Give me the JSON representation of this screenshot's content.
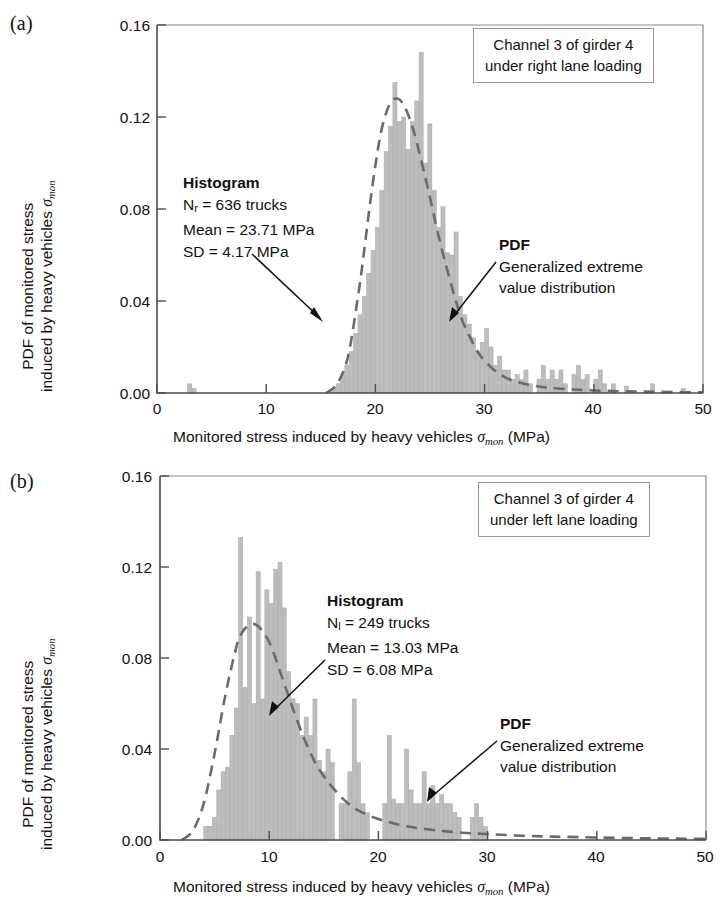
{
  "figure": {
    "panels": [
      {
        "id": "a",
        "panel_label": "(a)",
        "legend": {
          "line1": "Channel 3 of girder 4",
          "line2": "under right lane loading"
        },
        "histogram_annotation": {
          "header": "Histogram",
          "line1_prefix": "N",
          "line1_sub": "r",
          "line1_rest": " = 636 trucks",
          "line2": "Mean = 23.71 MPa",
          "line3": "SD = 4.17 MPa"
        },
        "pdf_annotation": {
          "header": "PDF",
          "line1": "Generalized extreme",
          "line2": "value distribution"
        }
      },
      {
        "id": "b",
        "panel_label": "(b)",
        "legend": {
          "line1": "Channel 3 of girder 4",
          "line2": "under left lane loading"
        },
        "histogram_annotation": {
          "header": "Histogram",
          "line1_prefix": "N",
          "line1_sub": "l",
          "line1_rest": " = 249 trucks",
          "line2": "Mean = 13.03 MPa",
          "line3": "SD = 6.08 MPa"
        },
        "pdf_annotation": {
          "header": "PDF",
          "line1": "Generalized extreme",
          "line2": "value distribution"
        }
      }
    ],
    "axis_label_parts": {
      "y_line1": "PDF of monitored stress",
      "y_line2_prefix": "induced by heavy vehicles ",
      "y_line2_symbol": "σ",
      "y_line2_symbol_sub": "mon",
      "x_prefix": "Monitored stress induced by heavy vehicles ",
      "x_symbol": "σ",
      "x_symbol_sub": "mon",
      "x_suffix": " (MPa)"
    },
    "colors": {
      "bar_fill": "#bdbdbd",
      "bar_edge": "#a8a8a8",
      "pdf_curve": "#6b6b6b",
      "axis": "#4d4d4d",
      "text": "#111111",
      "legend_border": "#9a9a9a"
    }
  },
  "chart_data": [
    {
      "type": "bar",
      "panel": "a",
      "title": "Channel 3 of girder 4 under right lane loading",
      "xlabel": "Monitored stress induced by heavy vehicles σ_mon (MPa)",
      "ylabel": "PDF of monitored stress induced by heavy vehicles σ_mon",
      "xlim": [
        0,
        50
      ],
      "ylim": [
        0,
        0.16
      ],
      "xticks": [
        0,
        10,
        20,
        30,
        40,
        50
      ],
      "ytick_labels": [
        "0.00",
        "0.04",
        "0.08",
        "0.12",
        "0.16"
      ],
      "yticks": [
        0.0,
        0.04,
        0.08,
        0.12,
        0.16
      ],
      "grid": false,
      "legend_position": "top-right",
      "n_samples": 636,
      "mean": 23.71,
      "sd": 4.17,
      "bin_width": 0.4,
      "bin_centers": [
        3.0,
        3.4,
        16.2,
        16.6,
        17.0,
        17.4,
        17.8,
        18.2,
        18.6,
        19.0,
        19.4,
        19.8,
        20.2,
        20.6,
        21.0,
        21.4,
        21.8,
        22.2,
        22.6,
        23.0,
        23.4,
        23.8,
        24.2,
        24.6,
        25.0,
        25.4,
        25.8,
        26.2,
        26.6,
        27.0,
        27.4,
        27.8,
        28.2,
        28.6,
        29.0,
        29.4,
        29.8,
        30.2,
        30.6,
        31.0,
        31.4,
        31.8,
        32.2,
        32.6,
        33.0,
        33.4,
        33.8,
        34.2,
        35.0,
        35.4,
        35.8,
        36.2,
        36.6,
        37.0,
        37.4,
        38.2,
        38.6,
        39.0,
        39.4,
        40.2,
        40.6,
        41.0,
        41.8,
        43.0,
        45.4,
        48.2
      ],
      "bin_values": [
        0.004,
        0.002,
        0.002,
        0.004,
        0.008,
        0.012,
        0.018,
        0.026,
        0.034,
        0.042,
        0.052,
        0.062,
        0.072,
        0.088,
        0.105,
        0.116,
        0.135,
        0.118,
        0.12,
        0.106,
        0.118,
        0.127,
        0.148,
        0.1,
        0.117,
        0.088,
        0.072,
        0.081,
        0.061,
        0.06,
        0.07,
        0.042,
        0.034,
        0.03,
        0.024,
        0.018,
        0.022,
        0.028,
        0.02,
        0.012,
        0.016,
        0.01,
        0.01,
        0.006,
        0.008,
        0.006,
        0.01,
        0.004,
        0.006,
        0.012,
        0.006,
        0.01,
        0.006,
        0.01,
        0.004,
        0.008,
        0.012,
        0.006,
        0.008,
        0.006,
        0.01,
        0.004,
        0.004,
        0.003,
        0.004,
        0.002
      ],
      "pdf_curve": {
        "name": "Generalized extreme value distribution",
        "style": "dashed",
        "x": [
          15.5,
          16.5,
          17.5,
          18.5,
          19.0,
          19.5,
          20.0,
          20.5,
          21.0,
          21.5,
          22.0,
          22.5,
          23.0,
          23.5,
          24.0,
          24.5,
          25.0,
          25.5,
          26.0,
          26.5,
          27.0,
          27.5,
          28.0,
          28.5,
          29.0,
          29.5,
          30.0,
          31.0,
          32.0,
          33.0,
          34.0,
          35.0,
          36.0,
          38.0,
          40.0,
          43.0,
          46.0,
          50.0
        ],
        "y": [
          0.0,
          0.004,
          0.016,
          0.045,
          0.063,
          0.082,
          0.099,
          0.113,
          0.122,
          0.127,
          0.128,
          0.126,
          0.121,
          0.114,
          0.105,
          0.095,
          0.085,
          0.074,
          0.064,
          0.055,
          0.046,
          0.038,
          0.031,
          0.026,
          0.021,
          0.017,
          0.014,
          0.0095,
          0.0065,
          0.0048,
          0.0036,
          0.0028,
          0.0022,
          0.0015,
          0.0011,
          0.0007,
          0.0005,
          0.0003
        ]
      }
    },
    {
      "type": "bar",
      "panel": "b",
      "title": "Channel 3 of girder 4 under left lane loading",
      "xlabel": "Monitored stress induced by heavy vehicles σ_mon (MPa)",
      "ylabel": "PDF of monitored stress induced by heavy vehicles σ_mon",
      "xlim": [
        0,
        50
      ],
      "ylim": [
        0,
        0.16
      ],
      "xticks": [
        0,
        10,
        20,
        30,
        40,
        50
      ],
      "ytick_labels": [
        "0.00",
        "0.04",
        "0.08",
        "0.12",
        "0.16"
      ],
      "yticks": [
        0.0,
        0.04,
        0.08,
        0.12,
        0.16
      ],
      "grid": false,
      "legend_position": "top-right",
      "n_samples": 249,
      "mean": 13.03,
      "sd": 6.08,
      "bin_width": 0.4,
      "bin_centers": [
        4.2,
        4.6,
        5.0,
        5.4,
        5.8,
        6.2,
        6.6,
        7.0,
        7.4,
        7.8,
        8.2,
        8.6,
        9.0,
        9.4,
        9.8,
        10.2,
        10.6,
        11.0,
        11.4,
        11.8,
        12.2,
        12.6,
        13.0,
        13.4,
        13.8,
        14.2,
        14.6,
        15.0,
        15.4,
        15.8,
        16.6,
        17.0,
        17.4,
        17.8,
        18.2,
        18.6,
        19.0,
        20.6,
        21.0,
        21.4,
        21.8,
        22.2,
        22.6,
        23.0,
        23.4,
        23.8,
        24.2,
        24.6,
        25.0,
        25.4,
        25.8,
        26.2,
        26.6,
        27.0,
        27.4,
        28.6,
        29.0,
        29.4,
        29.8
      ],
      "bin_values": [
        0.006,
        0.006,
        0.01,
        0.022,
        0.03,
        0.032,
        0.046,
        0.058,
        0.133,
        0.067,
        0.098,
        0.06,
        0.118,
        0.062,
        0.11,
        0.104,
        0.119,
        0.122,
        0.102,
        0.074,
        0.062,
        0.06,
        0.046,
        0.054,
        0.046,
        0.062,
        0.035,
        0.03,
        0.04,
        0.034,
        0.016,
        0.016,
        0.03,
        0.062,
        0.034,
        0.016,
        0.012,
        0.016,
        0.046,
        0.018,
        0.016,
        0.016,
        0.04,
        0.022,
        0.016,
        0.016,
        0.03,
        0.016,
        0.024,
        0.016,
        0.02,
        0.016,
        0.016,
        0.012,
        0.01,
        0.01,
        0.016,
        0.01,
        0.006
      ],
      "pdf_curve": {
        "name": "Generalized extreme value distribution",
        "style": "dashed",
        "x": [
          2.0,
          3.0,
          4.0,
          5.0,
          6.0,
          7.0,
          7.5,
          8.0,
          8.5,
          9.0,
          9.5,
          10.0,
          10.5,
          11.0,
          11.5,
          12.0,
          13.0,
          14.0,
          15.0,
          16.0,
          17.0,
          18.0,
          19.0,
          20.0,
          21.0,
          22.0,
          23.0,
          24.0,
          25.0,
          26.0,
          28.0,
          30.0,
          33.0,
          36.0,
          40.0,
          45.0,
          50.0
        ],
        "y": [
          0.0,
          0.004,
          0.016,
          0.038,
          0.064,
          0.085,
          0.091,
          0.094,
          0.095,
          0.094,
          0.091,
          0.087,
          0.081,
          0.074,
          0.067,
          0.06,
          0.047,
          0.036,
          0.028,
          0.022,
          0.017,
          0.0135,
          0.011,
          0.0092,
          0.0078,
          0.0066,
          0.0057,
          0.005,
          0.0044,
          0.0039,
          0.0031,
          0.0026,
          0.0019,
          0.0015,
          0.0011,
          0.0007,
          0.0005
        ]
      }
    }
  ]
}
